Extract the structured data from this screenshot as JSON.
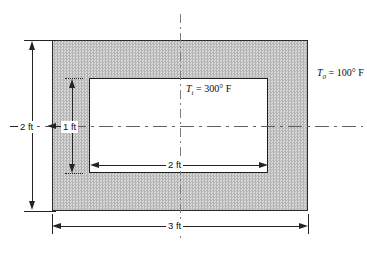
{
  "figure": {
    "name": "rectangular-duct-cross-section",
    "colors": {
      "outline": "#242424",
      "hatch_fill": "#c8c8c8",
      "inner_fill": "#ffffff",
      "centerline": "#6e6e6e"
    },
    "temperatures": {
      "inner": {
        "symbol": "T",
        "subscript": "i",
        "equals": "=",
        "value": "300",
        "unit": "° F",
        "full_text": "Tᵢ = 300° F"
      },
      "outer": {
        "symbol": "T",
        "subscript": "0",
        "equals": "=",
        "value": "100",
        "unit": "° F",
        "full_text": "T₀ = 100° F"
      }
    },
    "dimensions": {
      "outer_height": {
        "label": "2 ft",
        "value": 2,
        "unit": "ft",
        "orientation": "vertical",
        "position": "left-outside"
      },
      "inner_height": {
        "label": "1 ft",
        "value": 1,
        "unit": "ft",
        "orientation": "vertical",
        "position": "left-inside"
      },
      "inner_width": {
        "label": "2 ft",
        "value": 2,
        "unit": "ft",
        "orientation": "horizontal",
        "position": "inner-center"
      },
      "outer_width": {
        "label": "3 ft",
        "value": 3,
        "unit": "ft",
        "orientation": "horizontal",
        "position": "bottom-outside"
      }
    }
  }
}
